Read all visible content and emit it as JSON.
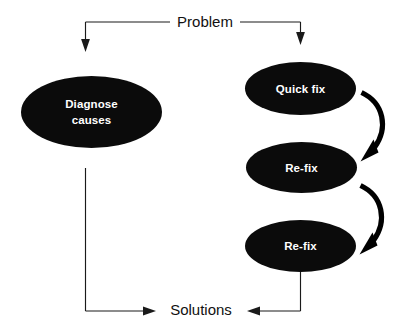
{
  "diagram": {
    "background_color": "#ffffff",
    "node_fill_color": "#0b0b0b",
    "node_text_color": "#ffffff",
    "connector_color": "#1a1a1a",
    "entry_label": "Problem",
    "exit_label": "Solutions",
    "nodes": [
      {
        "id": "diagnose",
        "label_line1": "Diagnose",
        "label_line2": "causes"
      },
      {
        "id": "quick-fix",
        "label": "Quick fix"
      },
      {
        "id": "re-fix-1",
        "label": "Re-fix"
      },
      {
        "id": "re-fix-2",
        "label": "Re-fix"
      }
    ],
    "branches": [
      {
        "id": "left-branch",
        "from": "Problem",
        "to": "Diagnose causes"
      },
      {
        "id": "right-branch",
        "from": "Problem",
        "to": "Quick fix"
      },
      {
        "id": "loop-1",
        "from": "Quick fix",
        "to": "Re-fix"
      },
      {
        "id": "loop-2",
        "from": "Re-fix",
        "to": "Re-fix"
      },
      {
        "id": "left-exit",
        "from": "Diagnose causes",
        "to": "Solutions"
      },
      {
        "id": "right-exit",
        "from": "Re-fix",
        "to": "Solutions"
      }
    ]
  }
}
